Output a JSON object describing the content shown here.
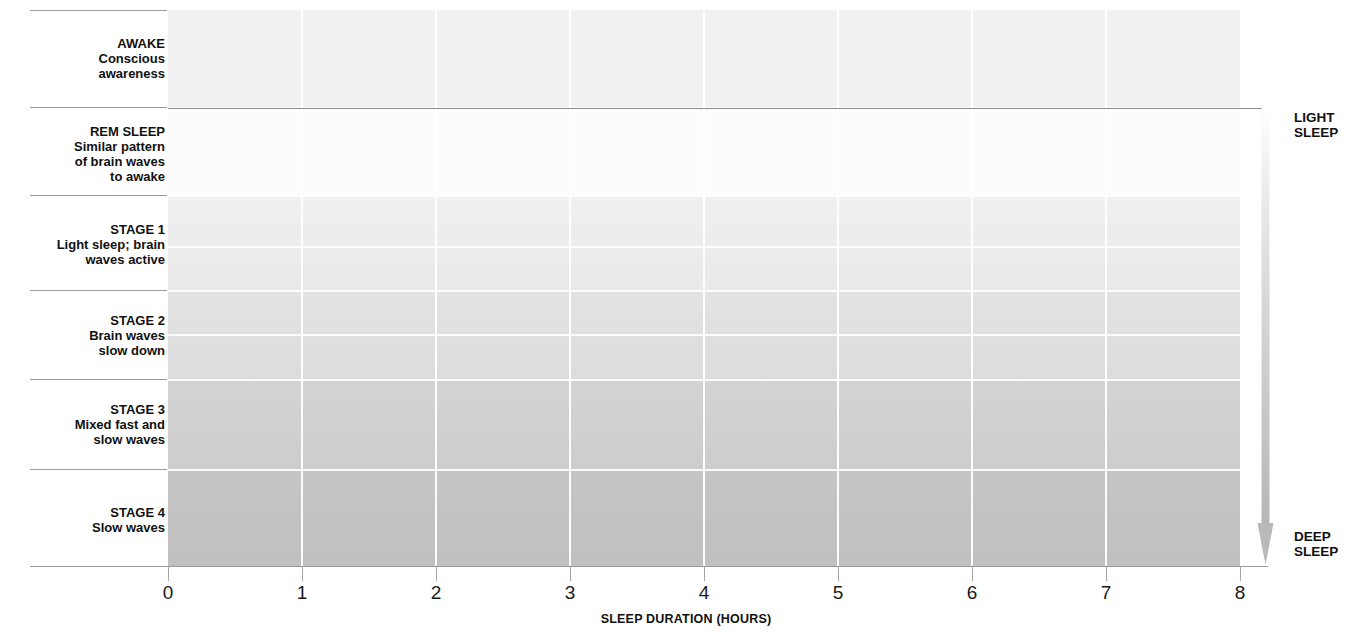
{
  "chart_data": {
    "type": "line",
    "xlabel": "SLEEP DURATION (HOURS)",
    "ylabel": "Sleep stage",
    "xlim": [
      0,
      8
    ],
    "xticks": [
      "0",
      "1",
      "2",
      "3",
      "4",
      "5",
      "6",
      "7",
      "8"
    ],
    "grid": true,
    "legend": "none",
    "stage_levels": [
      "AWAKE",
      "REM SLEEP",
      "STAGE 1",
      "STAGE 2",
      "STAGE 3",
      "STAGE 4"
    ],
    "series": [
      {
        "name": "Sleep stage over time",
        "step": "post",
        "points": [
          {
            "hour": 0.0,
            "stage": "AWAKE"
          },
          {
            "hour": 0.11,
            "stage": "AWAKE"
          },
          {
            "hour": 0.11,
            "stage": "STAGE 1"
          },
          {
            "hour": 0.22,
            "stage": "STAGE 1"
          },
          {
            "hour": 0.22,
            "stage": "STAGE 2"
          },
          {
            "hour": 0.42,
            "stage": "STAGE 2"
          },
          {
            "hour": 0.42,
            "stage": "STAGE 3"
          },
          {
            "hour": 0.91,
            "stage": "STAGE 3"
          },
          {
            "hour": 0.91,
            "stage": "STAGE 4"
          },
          {
            "hour": 1.5,
            "stage": "STAGE 4"
          },
          {
            "hour": 1.5,
            "stage": "STAGE 3"
          },
          {
            "hour": 1.93,
            "stage": "STAGE 3"
          },
          {
            "hour": 1.93,
            "stage": "STAGE 2"
          },
          {
            "hour": 2.05,
            "stage": "STAGE 2"
          },
          {
            "hour": 2.05,
            "stage": "REM SLEEP"
          },
          {
            "hour": 2.54,
            "stage": "REM SLEEP"
          },
          {
            "hour": 2.54,
            "stage": "STAGE 2"
          },
          {
            "hour": 2.66,
            "stage": "STAGE 2"
          },
          {
            "hour": 2.66,
            "stage": "STAGE 3"
          },
          {
            "hour": 2.78,
            "stage": "STAGE 3"
          },
          {
            "hour": 2.78,
            "stage": "STAGE 4"
          },
          {
            "hour": 3.33,
            "stage": "STAGE 4"
          },
          {
            "hour": 3.33,
            "stage": "STAGE 3"
          },
          {
            "hour": 3.55,
            "stage": "STAGE 3"
          },
          {
            "hour": 3.55,
            "stage": "STAGE 2"
          },
          {
            "hour": 3.67,
            "stage": "STAGE 2"
          },
          {
            "hour": 3.67,
            "stage": "REM SLEEP"
          },
          {
            "hour": 4.16,
            "stage": "REM SLEEP"
          },
          {
            "hour": 4.16,
            "stage": "STAGE 2"
          },
          {
            "hour": 4.27,
            "stage": "STAGE 2"
          },
          {
            "hour": 4.27,
            "stage": "STAGE 3"
          },
          {
            "hour": 4.78,
            "stage": "STAGE 3"
          },
          {
            "hour": 4.78,
            "stage": "STAGE 2"
          },
          {
            "hour": 4.92,
            "stage": "STAGE 2"
          },
          {
            "hour": 4.92,
            "stage": "REM SLEEP"
          },
          {
            "hour": 5.41,
            "stage": "REM SLEEP"
          },
          {
            "hour": 5.41,
            "stage": "STAGE 2"
          },
          {
            "hour": 6.03,
            "stage": "STAGE 2"
          },
          {
            "hour": 6.03,
            "stage": "REM SLEEP"
          },
          {
            "hour": 6.52,
            "stage": "REM SLEEP"
          },
          {
            "hour": 6.52,
            "stage": "STAGE 2"
          },
          {
            "hour": 7.15,
            "stage": "STAGE 2"
          },
          {
            "hour": 7.15,
            "stage": "STAGE 1"
          },
          {
            "hour": 7.27,
            "stage": "STAGE 1"
          },
          {
            "hour": 7.27,
            "stage": "AWAKE"
          },
          {
            "hour": 8.0,
            "stage": "AWAKE"
          }
        ]
      }
    ]
  },
  "stages": [
    {
      "title": "AWAKE",
      "line1": "Conscious",
      "line2": "awareness",
      "line3": ""
    },
    {
      "title": "REM SLEEP",
      "line1": "Similar pattern",
      "line2": "of brain waves",
      "line3": "to awake"
    },
    {
      "title": "STAGE 1",
      "line1": "Light sleep; brain",
      "line2": "waves active",
      "line3": ""
    },
    {
      "title": "STAGE 2",
      "line1": "Brain waves",
      "line2": "slow down",
      "line3": ""
    },
    {
      "title": "STAGE 3",
      "line1": "Mixed fast and",
      "line2": "slow waves",
      "line3": ""
    },
    {
      "title": "STAGE 4",
      "line1": "Slow waves",
      "line2": "",
      "line3": ""
    }
  ],
  "axis": {
    "title": "SLEEP DURATION (HOURS)",
    "ticks": [
      "0",
      "1",
      "2",
      "3",
      "4",
      "5",
      "6",
      "7",
      "8"
    ]
  },
  "depth_scale": {
    "top_line1": "LIGHT",
    "top_line2": "SLEEP",
    "bottom_line1": "DEEP",
    "bottom_line2": "SLEEP"
  },
  "colors": {
    "line": "#4d4d4d",
    "band_awake": "#f2f2f2",
    "band_rem": "#fbfbfb",
    "band_s1": "#ececec",
    "band_s2": "#e0e0e0",
    "band_s3": "#cfcfcf",
    "band_s4": "#c2c2c2",
    "gridline": "#ffffff",
    "axis": "#9a9a9a",
    "text": "#111111"
  }
}
